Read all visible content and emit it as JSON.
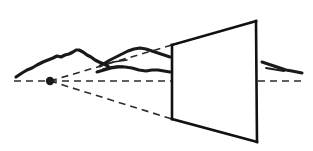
{
  "canvas": {
    "width": 313,
    "height": 151,
    "background": "#ffffff",
    "title": "One-point perspective picture-plane diagram"
  },
  "colors": {
    "ink": "#1a1a1a",
    "stroke": "#111111",
    "dash": "#2b2b2b",
    "background": "#ffffff"
  },
  "labels": {
    "vanishing_point": "",
    "horizon_line": "",
    "picture_plane": "",
    "cone_of_vision": "",
    "landscape": ""
  },
  "geometry": {
    "vanishing_point": {
      "x": 50,
      "y": 81,
      "r": 4.2
    },
    "horizon": {
      "y": 81,
      "segment_left": {
        "x1": 14,
        "x2": 171
      },
      "segment_right": {
        "x1": 258,
        "x2": 301
      },
      "dash": "7,5",
      "width": 1.7
    },
    "picture_plane": {
      "top_left": {
        "x": 172,
        "y": 45
      },
      "top_right": {
        "x": 256,
        "y": 21
      },
      "bottom_right": {
        "x": 257,
        "y": 142
      },
      "bottom_left": {
        "x": 172,
        "y": 119
      },
      "stroke_width": 2.6
    },
    "sight_lines": [
      {
        "name": "upper-ray",
        "x1": 50,
        "y1": 81,
        "x2": 172,
        "y2": 45,
        "dash": "7,5",
        "width": 1.6
      },
      {
        "name": "upper-ray-extension",
        "x1": 172,
        "y1": 45,
        "x2": 200,
        "y2": 37,
        "dash": "7,5",
        "width": 1.6
      },
      {
        "name": "lower-ray",
        "x1": 50,
        "y1": 81,
        "x2": 172,
        "y2": 119,
        "dash": "7,5",
        "width": 1.6
      }
    ],
    "landscape": {
      "left_ridge": "M 16,77 L 22,73 L 27,70 L 32,68 L 37,65 L 43,62 L 48,60 L 53,58 L 57,56 L 61,57 L 65,55 L 69,54 L 73,52 L 76,50 L 79,50 L 83,52 L 87,55 L 91,57 L 95,60 L 99,62 L 104,64 L 108,66",
      "mid_ridge_upper": "M 100,66 L 105,63 L 110,60 L 116,57 L 122,54 L 128,51 L 134,49 L 140,48 L 146,49 L 152,51 L 158,53 L 164,55 L 170,57",
      "mid_ridge_lower": "M 97,72 L 104,70 L 111,68 L 118,67 L 125,67 L 132,68 L 139,70 L 146,71 L 152,70 L 158,70 L 164,71 L 170,72",
      "mid_ridge_detail_a": "M 106,64 L 113,62 L 120,61 L 127,60",
      "mid_ridge_detail_b": "M 103,69 L 110,67 L 117,66 L 123,66",
      "right_ridge": "M 262,62 L 268,64 L 274,66 L 280,68 L 286,70 L 292,71 L 297,72 L 302,73",
      "right_ridge_lower": "M 266,68 L 272,69 L 278,70 L 284,71"
    }
  },
  "elements": {
    "vanishing_point_name": "vanishing-point",
    "horizon_name": "horizon-line",
    "plane_name": "picture-plane",
    "landscape_name": "landscape-silhouette"
  }
}
